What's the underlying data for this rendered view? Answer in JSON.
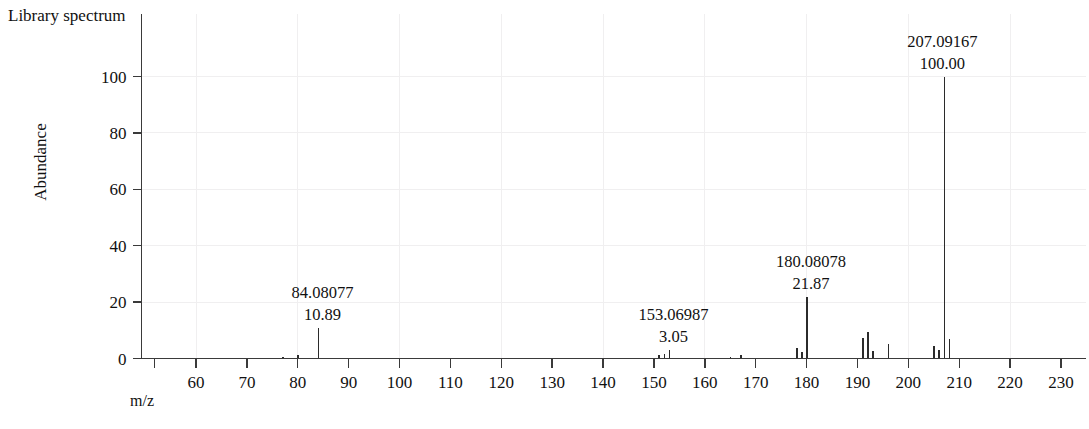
{
  "title": "Library spectrum",
  "axes": {
    "y_label": "Abundance",
    "x_label": "m/z",
    "y_ticks": [
      "0",
      "20",
      "40",
      "60",
      "80",
      "100"
    ],
    "x_ticks": [
      "60",
      "70",
      "80",
      "90",
      "100",
      "110",
      "120",
      "130",
      "140",
      "150",
      "160",
      "170",
      "180",
      "190",
      "200",
      "210",
      "220",
      "230"
    ]
  },
  "annotations": [
    {
      "mz": "84.08077",
      "abundance": "10.89"
    },
    {
      "mz": "153.06987",
      "abundance": "3.05"
    },
    {
      "mz": "180.08078",
      "abundance": "21.87"
    },
    {
      "mz": "207.09167",
      "abundance": "100.00"
    }
  ],
  "colors": {
    "peak": "#2b2b2b",
    "axis": "#3a3a3a",
    "grid": "#f0eff0",
    "text": "#111111",
    "background": "#ffffff"
  },
  "chart_data": {
    "type": "bar",
    "title": "Library spectrum",
    "xlabel": "m/z",
    "ylabel": "Abundance",
    "xlim": [
      55,
      236
    ],
    "ylim": [
      0,
      108
    ],
    "grid": true,
    "legend": null,
    "x": [
      77.03,
      80.05,
      84.08,
      151.05,
      152.06,
      153.07,
      165.07,
      167.08,
      178.07,
      179.08,
      180.08,
      191.09,
      192.09,
      193.09,
      196.09,
      205.09,
      206.09,
      207.09,
      208.09
    ],
    "values": [
      0.6,
      1.2,
      10.89,
      1.1,
      1.5,
      3.05,
      0.7,
      1.3,
      3.8,
      2.3,
      21.87,
      7.2,
      9.4,
      2.6,
      5.1,
      4.3,
      3.1,
      100.0,
      6.9
    ],
    "labeled_peaks": [
      {
        "mz": 84.08077,
        "abundance": 10.89
      },
      {
        "mz": 153.06987,
        "abundance": 3.05
      },
      {
        "mz": 180.08078,
        "abundance": 21.87
      },
      {
        "mz": 207.09167,
        "abundance": 100.0
      }
    ]
  }
}
